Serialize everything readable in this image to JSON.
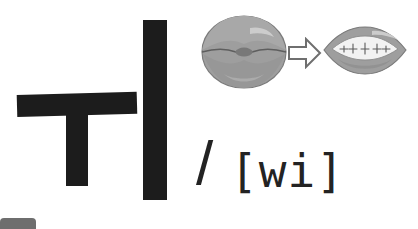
{
  "canvas": {
    "width": 418,
    "height": 229,
    "background_color": "#ffffff"
  },
  "hangul": {
    "syllable": "ㅟ",
    "stroke_color": "#1c1c1c",
    "strokes": [
      {
        "name": "u-horizontal",
        "jamo": "ㅜ"
      },
      {
        "name": "u-vertical",
        "jamo": "ㅜ"
      },
      {
        "name": "i-vertical",
        "jamo": "ㅣ"
      }
    ]
  },
  "mouth_diagrams": {
    "fill_color": "#9e9e9e",
    "outline_color": "#777777",
    "highlight_color": "#c9c9c9",
    "teeth_color": "#f2f2f2",
    "start": {
      "label": "rounded-lips",
      "description": "rounded pursed lips"
    },
    "end": {
      "label": "spread-lips",
      "description": "spread lips with teeth showing"
    }
  },
  "arrow": {
    "label": "transition-arrow",
    "direction": "right",
    "style": "outlined",
    "stroke_color": "#6f6f6f"
  },
  "phonetic": {
    "slash": "/",
    "transcription": "[wi]",
    "text_color": "#232323"
  },
  "chip": {
    "label": "bottom-left-chip",
    "color": "#6e6e6e"
  }
}
